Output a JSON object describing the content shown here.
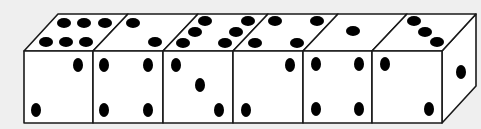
{
  "scene": {
    "description": "Row of six dice drawn as one connected block in isometric-style line art",
    "background": "#efefef",
    "face_color": "#ffffff",
    "stroke_color": "#1a1a1a",
    "pip_color": "#000000"
  },
  "dice": [
    {
      "index": 1,
      "top_pips": 6,
      "front_pips": 2
    },
    {
      "index": 2,
      "top_pips": 2,
      "front_pips": 4
    },
    {
      "index": 3,
      "top_pips": 6,
      "front_pips": 3
    },
    {
      "index": 4,
      "top_pips": 4,
      "front_pips": 2
    },
    {
      "index": 5,
      "top_pips": 1,
      "front_pips": 4
    },
    {
      "index": 6,
      "top_pips": 3,
      "front_pips": 2,
      "side_pips": 1
    }
  ]
}
